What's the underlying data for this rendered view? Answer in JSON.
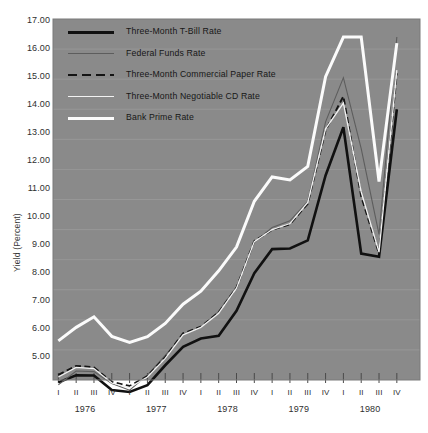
{
  "chart_data": {
    "type": "line",
    "title": "",
    "xlabel": "",
    "ylabel": "Yield (Percent)",
    "ylim": [
      5.0,
      17.0
    ],
    "ytick_labels": [
      "17.00",
      "16.00",
      "15.00",
      "14.00",
      "13.00",
      "12.00",
      "11.00",
      "10.00",
      "9.00",
      "8.00",
      "7.00",
      "6.00",
      "5.00"
    ],
    "ytick_values": [
      17,
      16,
      15,
      14,
      13,
      12,
      11,
      10,
      9,
      8,
      7,
      6,
      5
    ],
    "grid": true,
    "legend_position": "upper-left-inside",
    "x_quarter_labels": [
      "I",
      "II",
      "III",
      "IV",
      "I",
      "II",
      "III",
      "IV",
      "I",
      "II",
      "III",
      "IV",
      "I",
      "II",
      "III",
      "IV",
      "I",
      "II",
      "III",
      "IV"
    ],
    "x_year_labels": [
      "1976",
      "1977",
      "1978",
      "1979",
      "1980"
    ],
    "x": [
      "1976 I",
      "1976 II",
      "1976 III",
      "1976 IV",
      "1977 I",
      "1977 II",
      "1977 III",
      "1977 IV",
      "1978 I",
      "1978 II",
      "1978 III",
      "1978 IV",
      "1979 I",
      "1979 II",
      "1979 III",
      "1979 IV",
      "1980 I",
      "1980 II",
      "1980 III",
      "1980 IV"
    ],
    "series": [
      {
        "name": "Three-Month T-Bill Rate",
        "style": "solid-thick-black",
        "color": "#111111",
        "width": 2.6,
        "dash": "none",
        "values": [
          4.92,
          5.16,
          5.15,
          4.67,
          4.6,
          4.83,
          5.49,
          6.1,
          6.38,
          6.47,
          7.3,
          8.55,
          9.35,
          9.37,
          9.64,
          11.8,
          13.4,
          9.2,
          9.1,
          14.0
        ]
      },
      {
        "name": "Federal Funds Rate",
        "style": "solid-thin-dark",
        "color": "#5d5d5d",
        "width": 1.1,
        "dash": "none",
        "values": [
          4.84,
          5.3,
          5.28,
          4.88,
          4.66,
          5.16,
          5.82,
          6.51,
          6.76,
          7.28,
          8.1,
          9.58,
          10.07,
          10.29,
          10.94,
          13.58,
          15.05,
          12.69,
          9.84,
          16.4
        ]
      },
      {
        "name": "Three-Month Commercial Paper Rate",
        "style": "dashed-black",
        "color": "#141414",
        "width": 1.9,
        "dash": "6,3.4",
        "values": [
          5.17,
          5.47,
          5.42,
          4.94,
          4.8,
          5.13,
          5.76,
          6.55,
          6.77,
          7.25,
          8.07,
          9.62,
          9.99,
          10.18,
          10.86,
          13.3,
          14.43,
          11.1,
          9.2,
          15.2
        ]
      },
      {
        "name": "Three-Month Negotiable CD Rate",
        "style": "solid-thin-white",
        "color": "#f2f2f2",
        "width": 1.3,
        "dash": "none",
        "values": [
          5.1,
          5.42,
          5.38,
          4.9,
          4.75,
          5.1,
          5.72,
          6.5,
          6.75,
          7.22,
          8.05,
          9.6,
          10.0,
          10.2,
          10.9,
          13.35,
          14.2,
          11.25,
          9.25,
          15.3
        ]
      },
      {
        "name": "Bank Prime Rate",
        "style": "solid-thick-white",
        "color": "#fbfbfb",
        "width": 3.0,
        "dash": "none",
        "values": [
          6.3,
          6.75,
          7.1,
          6.45,
          6.25,
          6.44,
          6.88,
          7.52,
          7.95,
          8.63,
          9.42,
          10.94,
          11.75,
          11.65,
          12.1,
          15.08,
          16.4,
          16.4,
          11.6,
          16.2
        ]
      }
    ],
    "legend_entries": [
      {
        "label": "Three-Month T-Bill Rate"
      },
      {
        "label": "Federal Funds Rate"
      },
      {
        "label": "Three-Month Commercial Paper Rate"
      },
      {
        "label": "Three-Month Negotiable CD Rate"
      },
      {
        "label": "Bank Prime Rate"
      }
    ],
    "colors": {
      "plot_background": "#8a8a8a",
      "page_background": "#ffffff",
      "gridline": "#9a9a9a",
      "axis_text": "#2f2f2f",
      "plot_border": "#7a7a7a"
    }
  }
}
